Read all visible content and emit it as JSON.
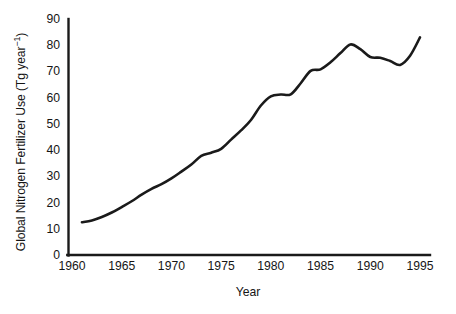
{
  "chart_data": {
    "type": "line",
    "title": "",
    "xlabel": "Year",
    "ylabel": "Global Nitrogen Fertilizer Use (Tg year−1)",
    "ylabel_base": "Global Nitrogen Fertilizer Use (Tg year",
    "ylabel_exponent": "−1",
    "ylabel_tail": ")",
    "xlim": [
      1960,
      1995
    ],
    "ylim": [
      0,
      90
    ],
    "grid": false,
    "legend": null,
    "xticks": [
      1960,
      1965,
      1970,
      1975,
      1980,
      1985,
      1990,
      1995
    ],
    "xtick_labels": [
      "1960",
      "1965",
      "1970",
      "1975",
      "1980",
      "1985",
      "1990",
      "1995"
    ],
    "yticks": [
      0,
      10,
      20,
      30,
      40,
      50,
      60,
      70,
      80,
      90
    ],
    "ytick_labels": [
      "0",
      "10",
      "20",
      "30",
      "40",
      "50",
      "60",
      "70",
      "80",
      "90"
    ],
    "series": [
      {
        "name": "Global nitrogen fertilizer use",
        "color": "#1a1a1a",
        "line_width": 2.6,
        "x": [
          1961,
          1962,
          1963,
          1964,
          1965,
          1966,
          1967,
          1968,
          1969,
          1970,
          1971,
          1972,
          1973,
          1974,
          1975,
          1976,
          1977,
          1978,
          1979,
          1980,
          1981,
          1982,
          1983,
          1984,
          1985,
          1986,
          1987,
          1988,
          1989,
          1990,
          1991,
          1992,
          1993,
          1994,
          1995
        ],
        "y": [
          12.5,
          13.2,
          14.5,
          16.2,
          18.3,
          20.5,
          23.0,
          25.2,
          27.0,
          29.2,
          31.8,
          34.5,
          37.8,
          39.0,
          40.5,
          44.0,
          47.5,
          51.5,
          57.0,
          60.5,
          61.2,
          61.3,
          65.5,
          70.2,
          70.8,
          73.5,
          77.0,
          80.3,
          78.5,
          75.5,
          75.2,
          74.0,
          72.5,
          76.0,
          83.0
        ]
      }
    ]
  },
  "axes": {
    "y_axis_name": "y-axis",
    "x_axis_name": "x-axis"
  }
}
